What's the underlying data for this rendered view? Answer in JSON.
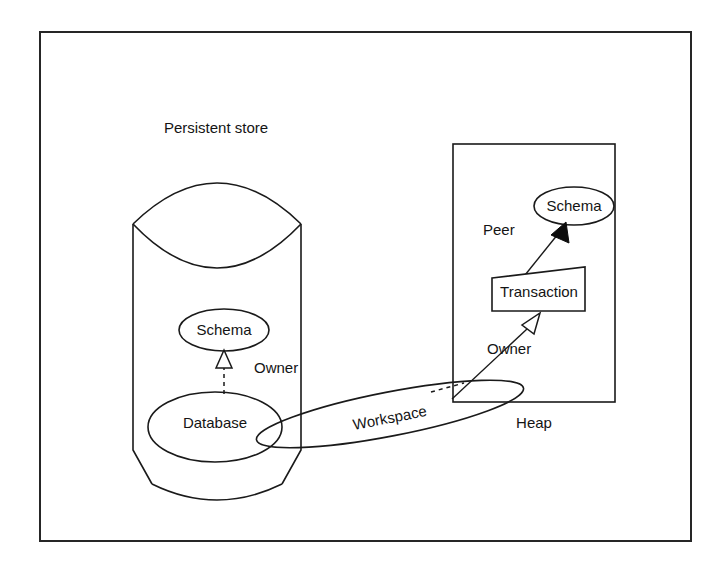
{
  "diagram": {
    "title_visible": false,
    "background_color": "#ffffff",
    "line_color": "#1a1a1a",
    "frame": {
      "name": "outer-frame",
      "x": 40,
      "y": 32,
      "width": 651,
      "height": 509
    },
    "containers": [
      {
        "id": "persistent-store",
        "label": "Persistent store",
        "shape": "cylinder",
        "label_x": 216,
        "label_y": 129,
        "label_anchor": "middle"
      },
      {
        "id": "heap",
        "label": "Heap",
        "shape": "rectangle",
        "label_x": 534,
        "label_y": 424,
        "label_anchor": "middle"
      }
    ],
    "nodes": [
      {
        "id": "schema-store",
        "label": "Schema",
        "shape": "ellipse",
        "cx": 224,
        "cy": 330,
        "rx": 45,
        "ry": 21
      },
      {
        "id": "database",
        "label": "Database",
        "shape": "ellipse",
        "cx": 215,
        "cy": 427,
        "rx": 67,
        "ry": 35
      },
      {
        "id": "workspace",
        "label": "Workspace",
        "shape": "rotated-ellipse",
        "cx": 390,
        "cy": 414,
        "rx": 136,
        "ry": 22,
        "rotation_deg": -11,
        "label_x": 390,
        "label_y": 418
      },
      {
        "id": "schema-heap",
        "label": "Schema",
        "shape": "ellipse",
        "cx": 574,
        "cy": 206,
        "rx": 40,
        "ry": 19
      },
      {
        "id": "transaction",
        "label": "Transaction",
        "shape": "skewed-rectangle",
        "label_x": 538,
        "label_y": 292
      }
    ],
    "edges": [
      {
        "id": "database-owner-schema",
        "label": "Owner",
        "from": "database",
        "to": "schema-store",
        "line_style": "dashed",
        "arrow_head": "hollow-triangle",
        "label_x": 254,
        "label_y": 369
      },
      {
        "id": "transaction-peer-schema",
        "label": "Peer",
        "from": "transaction",
        "to": "schema-heap",
        "line_style": "solid",
        "arrow_head": "solid-triangle",
        "label_x": 506,
        "label_y": 231
      },
      {
        "id": "workspace-owner-transaction",
        "label": "Owner",
        "from": "workspace",
        "to": "transaction",
        "line_style": "solid",
        "arrow_head": "hollow-triangle",
        "label_x": 493,
        "label_y": 350
      }
    ]
  }
}
